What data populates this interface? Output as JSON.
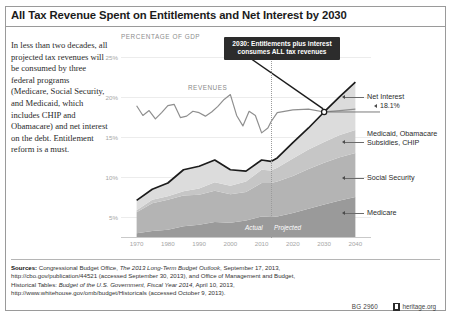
{
  "title": "All Tax Revenue Spent on Entitlements and Net Interest by 2030",
  "intro": "In less than two decades, all projected tax revenues will be consumed by three federal programs (Medicare, Social Security, and Medicaid, which includes CHIP and Obamacare) and net interest on the debt. Entitlement reform is a must.",
  "callout": "2030: Entitlements plus interest consumes ALL tax revenues",
  "annotations": {
    "net_interest": "Net Interest",
    "crossing_value": "18.1%",
    "medicaid": "Medicaid, Obamacare Subsidies, CHIP",
    "social_security": "Social Security",
    "medicare": "Medicare",
    "revenues": "REVENUES",
    "actual": "Actual",
    "projected": "Projected"
  },
  "sources": {
    "label": "Sources:",
    "line1_a": " Congressional Budget Office, ",
    "line1_i": "The 2013 Long-Term Budget Outlook",
    "line1_b": ", September 17, 2013,",
    "line2": "http://cbo.gov/publication/44521 (accessed September 30, 2013), and Office of Management and Budget,",
    "line3_a": "Historical Tables: ",
    "line3_i": "Budget of the U.S. Government, Fiscal Year 2014",
    "line3_b": ", April 10, 2013,",
    "line4": "http://www.whitehouse.gov/omb/budget/Historicals (accessed October 9, 2013)."
  },
  "footer": {
    "bg_number": "BG 2960",
    "site": "heritage.org"
  },
  "chart_data": {
    "type": "area",
    "title": "All Tax Revenue Spent on Entitlements and Net Interest by 2030",
    "ylabel": "PERCENTAGE OF GDP",
    "xlabel": "",
    "ylim": [
      0,
      27
    ],
    "xlim": [
      1965,
      2045
    ],
    "yticks": [
      5,
      10,
      15,
      20,
      25
    ],
    "ytick_labels": [
      "5%",
      "10%",
      "15%",
      "20%",
      "25%"
    ],
    "xticks": [
      1970,
      1980,
      1990,
      2000,
      2010,
      2020,
      2030,
      2040
    ],
    "xtick_labels": [
      "1970",
      "1980",
      "1990",
      "2000",
      "2010",
      "2020",
      "2030",
      "2040"
    ],
    "grid": false,
    "legend": "right-side direct labels",
    "actual_projected_split": 2013,
    "crossing_point": {
      "year": 2030,
      "value": 18.1
    },
    "x": [
      1970,
      1975,
      1980,
      1985,
      1990,
      1995,
      2000,
      2005,
      2010,
      2013,
      2015,
      2020,
      2025,
      2030,
      2035,
      2040
    ],
    "series": [
      {
        "name": "Medicare",
        "color": "#9a9a9a",
        "values": [
          0.7,
          1.0,
          1.2,
          1.7,
          1.9,
          2.3,
          2.2,
          2.5,
          3.1,
          3.0,
          3.1,
          3.6,
          4.2,
          4.8,
          5.4,
          5.9
        ]
      },
      {
        "name": "Social Security",
        "color": "#b4b4b4",
        "values": [
          3.0,
          4.0,
          4.3,
          4.4,
          4.3,
          4.5,
          4.1,
          4.1,
          4.8,
          4.9,
          5.0,
          5.3,
          5.7,
          6.0,
          6.2,
          6.3
        ]
      },
      {
        "name": "Medicaid, Obamacare Subsidies, CHIP",
        "color": "#c6c6c6",
        "values": [
          0.3,
          0.5,
          0.5,
          0.6,
          0.9,
          1.2,
          1.2,
          1.5,
          1.9,
          1.8,
          2.0,
          2.5,
          2.8,
          3.0,
          3.2,
          3.3
        ]
      },
      {
        "name": "Net Interest",
        "color": "#dcdcdc",
        "values": [
          1.4,
          1.5,
          1.9,
          3.1,
          3.2,
          3.2,
          2.3,
          1.5,
          1.4,
          1.3,
          1.4,
          2.3,
          3.1,
          4.3,
          5.5,
          6.9
        ]
      }
    ],
    "revenue_line": {
      "name": "REVENUES",
      "color": "#8f8f8f",
      "x": [
        1970,
        1972,
        1974,
        1976,
        1978,
        1980,
        1982,
        1984,
        1986,
        1988,
        1990,
        1992,
        1994,
        1996,
        1998,
        2000,
        2002,
        2004,
        2006,
        2008,
        2010,
        2012,
        2013,
        2015,
        2020,
        2025,
        2030,
        2035,
        2040
      ],
      "values": [
        19.0,
        17.6,
        18.3,
        17.1,
        18.0,
        19.0,
        19.2,
        17.3,
        17.5,
        18.2,
        18.0,
        17.5,
        18.1,
        18.9,
        19.9,
        20.6,
        17.6,
        16.1,
        18.2,
        17.6,
        15.1,
        15.8,
        16.7,
        18.0,
        18.4,
        18.5,
        18.1,
        18.3,
        18.5
      ]
    },
    "total_line": {
      "name": "Total entitlements plus net interest",
      "color": "#1c1c1c",
      "values": [
        5.4,
        7.0,
        7.9,
        9.8,
        10.3,
        11.2,
        9.8,
        9.6,
        11.2,
        11.0,
        11.5,
        13.7,
        15.8,
        18.1,
        20.3,
        22.4
      ]
    }
  }
}
